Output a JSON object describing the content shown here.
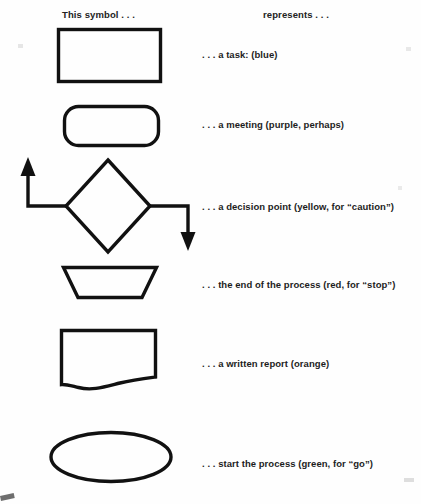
{
  "header": {
    "symbol_column": "This symbol . . .",
    "represents_column": "represents . . ."
  },
  "legend": {
    "rows": [
      {
        "shape": "rectangle",
        "shape_icon": "rectangle-shape-icon",
        "label": ". . . a task: (blue)",
        "color_word": "blue"
      },
      {
        "shape": "rounded-rectangle",
        "shape_icon": "rounded-rectangle-shape-icon",
        "label": ". . . a meeting (purple, perhaps)",
        "color_word": "purple"
      },
      {
        "shape": "diamond-with-arrows",
        "shape_icon": "diamond-decision-shape-icon",
        "label": ". . . a decision point (yellow, for “caution”)",
        "color_word": "yellow"
      },
      {
        "shape": "trapezoid",
        "shape_icon": "trapezoid-shape-icon",
        "label": ". . . the end of the process (red, for “stop”)",
        "color_word": "red"
      },
      {
        "shape": "document",
        "shape_icon": "document-shape-icon",
        "label": ". . . a written report (orange)",
        "color_word": "orange"
      },
      {
        "shape": "ellipse",
        "shape_icon": "ellipse-shape-icon",
        "label": ". . . start the process (green, for “go”)",
        "color_word": "green"
      }
    ]
  },
  "style": {
    "ink": "#111111",
    "paper": "#fefefe"
  }
}
